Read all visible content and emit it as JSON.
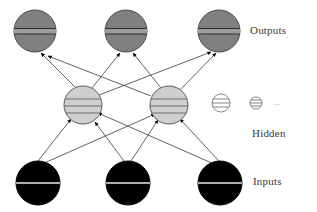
{
  "diagram": {
    "canvas": {
      "width": 317,
      "height": 212,
      "background": "#ffffff"
    },
    "labels": {
      "outputs": "Outputs",
      "hidden": "Hidden",
      "inputs": "Inputs",
      "ellipsis": "..."
    },
    "colors": {
      "output_node_fill": "#808080",
      "output_node_stroke": "#4a4a4a",
      "hidden_node_fill": "#cfcfcf",
      "hidden_node_stroke": "#5a5a5a",
      "small_hidden_fill": "#ffffff",
      "small_hidden_stroke": "#777777",
      "input_node_fill": "#000000",
      "input_node_stroke": "#000000",
      "input_node_line": "#e8e8e8",
      "edge_stroke": "#3b3b3b",
      "arrowhead_fill": "#000000",
      "label_text": "#3a3a3a"
    },
    "layers": [
      {
        "name": "outputs",
        "node_style": "dark-gray-striped-circle",
        "radius": 21,
        "nodes": [
          {
            "id": "o1",
            "cx": 35,
            "cy": 31
          },
          {
            "id": "o2",
            "cx": 126,
            "cy": 31
          },
          {
            "id": "o3",
            "cx": 219,
            "cy": 31
          }
        ]
      },
      {
        "name": "hidden",
        "node_style": "light-gray-striped-circle",
        "radius": 19,
        "nodes": [
          {
            "id": "h1",
            "cx": 83,
            "cy": 105
          },
          {
            "id": "h2",
            "cx": 169,
            "cy": 105
          }
        ],
        "extra_nodes": [
          {
            "id": "h3",
            "cx": 221,
            "cy": 103,
            "radius": 9,
            "style": "small-striped-circle"
          },
          {
            "id": "h4",
            "cx": 256,
            "cy": 103,
            "radius": 6,
            "style": "small-striped-circle"
          }
        ],
        "ellipsis_position": {
          "x": 277,
          "y": 100
        }
      },
      {
        "name": "inputs",
        "node_style": "black-split-circle",
        "radius": 22,
        "nodes": [
          {
            "id": "i1",
            "cx": 38,
            "cy": 183
          },
          {
            "id": "i2",
            "cx": 128,
            "cy": 183
          },
          {
            "id": "i3",
            "cx": 220,
            "cy": 183
          }
        ]
      }
    ],
    "edges": {
      "hidden_to_output": [
        {
          "from": "h1",
          "to": "o1"
        },
        {
          "from": "h1",
          "to": "o2"
        },
        {
          "from": "h1",
          "to": "o3"
        },
        {
          "from": "h2",
          "to": "o1"
        },
        {
          "from": "h2",
          "to": "o2"
        },
        {
          "from": "h2",
          "to": "o3"
        }
      ],
      "input_to_hidden": [
        {
          "from": "i1",
          "to": "h1"
        },
        {
          "from": "i1",
          "to": "h2"
        },
        {
          "from": "i2",
          "to": "h1"
        },
        {
          "from": "i2",
          "to": "h2"
        },
        {
          "from": "i3",
          "to": "h1"
        },
        {
          "from": "i3",
          "to": "h2"
        }
      ],
      "direction": "bottom-to-top",
      "arrowhead": "solid-triangle"
    }
  }
}
